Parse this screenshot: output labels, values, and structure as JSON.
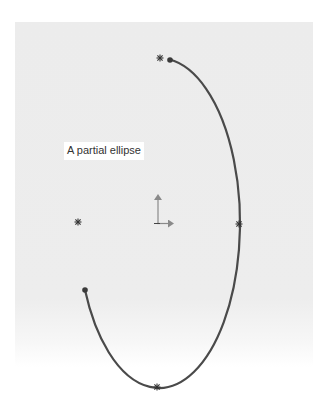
{
  "title": "A partial ellipse",
  "diagram": {
    "type": "sketch-partial-ellipse",
    "label": "A partial ellipse",
    "colors": {
      "curve": "#4a4a4a",
      "background": "#ececec",
      "axis_arrow": "#8a8a8a",
      "point_marker": "#333333"
    },
    "elements": [
      {
        "name": "partial-ellipse-arc",
        "kind": "arc"
      },
      {
        "name": "arc-start-point",
        "kind": "endpoint"
      },
      {
        "name": "arc-end-point",
        "kind": "endpoint"
      },
      {
        "name": "top-quadrant-point",
        "kind": "point-marker"
      },
      {
        "name": "right-quadrant-point",
        "kind": "point-marker"
      },
      {
        "name": "bottom-quadrant-point",
        "kind": "point-marker"
      },
      {
        "name": "left-quadrant-point",
        "kind": "point-marker"
      },
      {
        "name": "origin-axes",
        "kind": "axis-triad"
      }
    ]
  }
}
